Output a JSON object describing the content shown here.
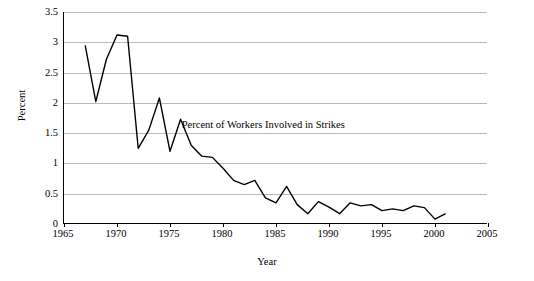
{
  "chart_data": {
    "type": "line",
    "title": "",
    "xlabel": "Year",
    "ylabel": "Percent",
    "xlim": [
      1965,
      2005
    ],
    "ylim": [
      0,
      3.5
    ],
    "xticks": [
      1965,
      1970,
      1975,
      1980,
      1985,
      1990,
      1995,
      2000,
      2005
    ],
    "yticks": [
      0,
      0.5,
      1,
      1.5,
      2,
      2.5,
      3,
      3.5
    ],
    "ytick_labels": [
      "0",
      "0.5",
      "1",
      "1.5",
      "2",
      "2.5",
      "3",
      "3.5"
    ],
    "grid": "horizontal",
    "legend": "none",
    "annotations": [
      {
        "text": "Percent of Workers Involved in Strikes",
        "x": 1976.2,
        "y": 1.62
      }
    ],
    "series": [
      {
        "name": "Percent of Workers Involved in Strikes",
        "color": "#000000",
        "x": [
          1967,
          1968,
          1969,
          1970,
          1971,
          1972,
          1973,
          1974,
          1975,
          1976,
          1977,
          1978,
          1979,
          1980,
          1981,
          1982,
          1983,
          1984,
          1985,
          1986,
          1987,
          1988,
          1989,
          1990,
          1991,
          1992,
          1993,
          1994,
          1995,
          1996,
          1997,
          1998,
          1999,
          2000,
          2001
        ],
        "values": [
          2.95,
          2.02,
          2.72,
          3.12,
          3.1,
          1.25,
          1.55,
          2.08,
          1.2,
          1.73,
          1.3,
          1.12,
          1.1,
          0.92,
          0.72,
          0.65,
          0.72,
          0.43,
          0.35,
          0.62,
          0.32,
          0.17,
          0.37,
          0.28,
          0.17,
          0.35,
          0.3,
          0.32,
          0.22,
          0.25,
          0.22,
          0.3,
          0.27,
          0.08,
          0.17
        ]
      }
    ]
  }
}
